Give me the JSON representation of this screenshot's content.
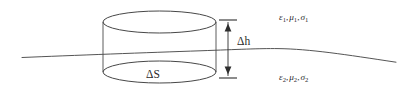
{
  "figure": {
    "background_color": "#ffffff",
    "line_color": "#4a4a4a",
    "text_color": "#2b2b2b",
    "width": 406,
    "height": 94
  },
  "labels": {
    "height_dimension": "Δh",
    "area_label": "ΔS",
    "medium_upper": {
      "permittivity": "ε",
      "permittivity_sub": "1",
      "permeability": "μ",
      "permeability_sub": "1",
      "conductivity": "σ",
      "conductivity_sub": "2",
      "full_text": "ε₁, μ₁, σ₁"
    },
    "medium_lower": {
      "permittivity": "ε",
      "permittivity_sub": "2",
      "permeability": "μ",
      "permeability_sub": "2",
      "conductivity": "σ",
      "conductivity_sub": "2",
      "full_text": "ε₂, μ₂, σ₂"
    },
    "separator_comma": ","
  },
  "geometry": {
    "cylinder": {
      "center_x": 159.5,
      "left_x": 103,
      "right_x": 216,
      "radius_x": 56.5,
      "radius_y": 11,
      "top_ellipse_cy": 22,
      "bottom_ellipse_cy": 72
    },
    "dimension": {
      "axis_x": 228,
      "top_y": 20,
      "bottom_y": 78,
      "tick_half_width": 9
    },
    "interface_curve": "M 22 57.5 C 70 55.5, 150 52.5, 200 50.8 C 240 49.4, 258 48.4, 278 48.6 C 310 49.0, 345 54.5, 396 62.2"
  }
}
